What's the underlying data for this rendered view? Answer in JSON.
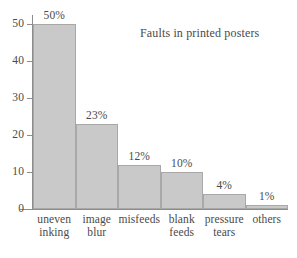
{
  "chart_data": {
    "type": "bar",
    "title": "Faults in printed posters",
    "xlabel": "",
    "ylabel": "",
    "ylim": [
      0,
      50
    ],
    "grid": false,
    "legend": false,
    "categories": [
      "uneven\ninking",
      "image\nblur",
      "misfeeds",
      "blank\nfeeds",
      "pressure\ntears",
      "others"
    ],
    "values": [
      50,
      23,
      12,
      10,
      4,
      1
    ],
    "data_labels": [
      "50%",
      "23%",
      "12%",
      "10%",
      "4%",
      "1%"
    ],
    "y_ticks": [
      0,
      10,
      20,
      30,
      40,
      50
    ],
    "y_tick_labels": [
      "0",
      "10",
      "20",
      "30",
      "40",
      "50"
    ],
    "bar_color": "#c9c9c9",
    "bar_border_color": "#a8a8a8",
    "axis_color": "#8c8c8c",
    "text_color": "#4a4a4a",
    "background_color": "#ffffff"
  }
}
